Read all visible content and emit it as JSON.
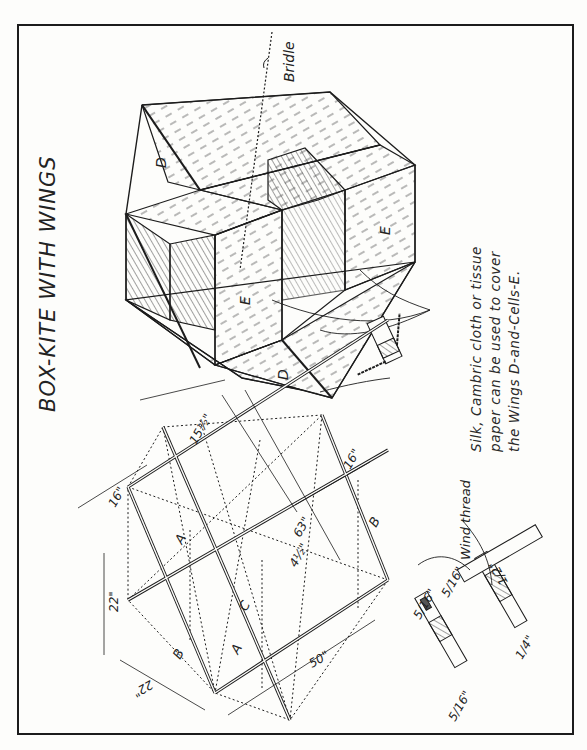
{
  "title": "BOX-KITE WITH WINGS",
  "note": {
    "lines": [
      "Silk, Cambric cloth or tissue",
      "paper can be used to cover",
      "the Wings D-and-Cells-E."
    ]
  },
  "labels": {
    "bridle": "Bridle",
    "wind_thread": "Wind thread",
    "wing_upper": "D",
    "wing_lower": "D",
    "cell_left": "E",
    "cell_right": "E"
  },
  "frame_parts": {
    "spar_a_1": "A",
    "spar_a_2": "A",
    "spar_b_1": "B",
    "spar_b_2": "B",
    "spar_c": "C"
  },
  "dimensions": {
    "d_16_left": "16\"",
    "d_15_half": "15½\"",
    "d_16_right": "16\"",
    "d_63": "63\"",
    "d_4_half": "4½\"",
    "d_22_vertical": "22\"",
    "d_22_diag": "22\"",
    "d_50": "50\""
  },
  "joint_detail": {
    "d_5_16_a": "5/16\"",
    "d_5_16_b": "5/16\"",
    "d_5_16_c": "5/16\"",
    "d_1_2": "1/2\"",
    "d_1_4": "1/4\""
  },
  "colors": {
    "ink": "#1c1c1c",
    "paper": "#fdfdfb",
    "hatch": "#555555"
  }
}
